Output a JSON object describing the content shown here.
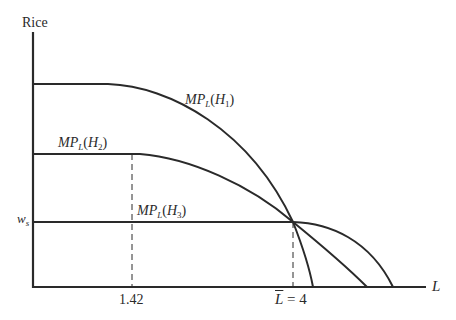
{
  "diagram": {
    "y_axis_label": "Rice",
    "x_axis_label": "L",
    "wage_label": {
      "main": "w",
      "sub": "s"
    },
    "x_ticks": [
      {
        "label": "1.42"
      },
      {
        "label_main": "L",
        "label_rest": " = 4"
      }
    ],
    "curves": [
      {
        "name": "MP_L(H1)",
        "main": "MP",
        "sub": "L",
        "paren_open": "(",
        "h": "H",
        "h_sub": "1",
        "paren_close": ")"
      },
      {
        "name": "MP_L(H2)",
        "main": "MP",
        "sub": "L",
        "paren_open": "(",
        "h": "H",
        "h_sub": "2",
        "paren_close": ")"
      },
      {
        "name": "MP_L(H3)",
        "main": "MP",
        "sub": "L",
        "paren_open": "(",
        "h": "H",
        "h_sub": "3",
        "paren_close": ")"
      }
    ],
    "colors": {
      "line": "#2a2a2a",
      "background": "#ffffff"
    }
  }
}
